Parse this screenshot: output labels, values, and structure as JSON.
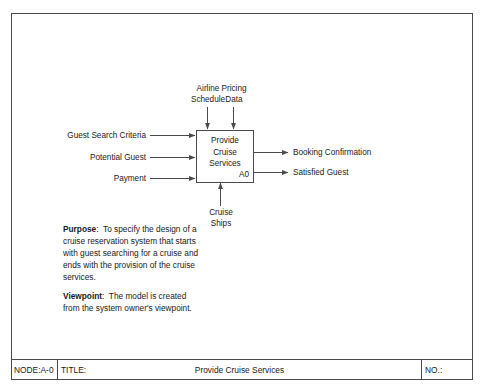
{
  "diagram": {
    "type": "IDEF0 context diagram",
    "activity": {
      "title_line1": "Provide",
      "title_line2": "Cruise",
      "title_line3": "Services",
      "number": "A0"
    },
    "controls": [
      {
        "name": "airline-schedule",
        "line1": "Airline",
        "line2": "Schedule"
      },
      {
        "name": "pricing-data",
        "line1": "Pricing",
        "line2": "Data"
      }
    ],
    "inputs": [
      {
        "name": "guest-search-criteria",
        "label": "Guest Search Criteria"
      },
      {
        "name": "potential-guest",
        "label": "Potential Guest"
      },
      {
        "name": "payment",
        "label": "Payment"
      }
    ],
    "outputs": [
      {
        "name": "booking-confirmation",
        "label": "Booking Confirmation"
      },
      {
        "name": "satisfied-guest",
        "label": "Satisfied Guest"
      }
    ],
    "mechanisms": [
      {
        "name": "cruise-ships",
        "line1": "Cruise",
        "line2": "Ships"
      }
    ]
  },
  "notes": {
    "purpose": {
      "heading": "Purpose",
      "separator": ":",
      "lines": [
        "To specify the design of a",
        "cruise reservation system that starts",
        "with guest searching for a cruise and",
        "ends with the provision of the cruise",
        "services."
      ]
    },
    "viewpoint": {
      "heading": "Viewpoint",
      "separator": ":",
      "lines": [
        "The model is created",
        "from the system owner's viewpoint."
      ]
    }
  },
  "title_bar": {
    "node_label": "NODE:",
    "node_value": "A-0",
    "title_label": "TITLE:",
    "title_value": "Provide Cruise Services",
    "number_label": "NO.:"
  },
  "colors": {
    "line": "#4a4a4a",
    "text": "#1a1a1a",
    "background": "#ffffff"
  }
}
